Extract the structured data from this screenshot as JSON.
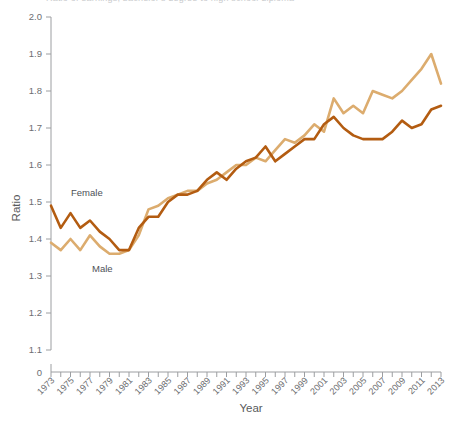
{
  "figure": {
    "title_clipped": "Ratio of earnings, bachelor's degree to high school diploma",
    "ylabel": "Ratio",
    "xlabel": "Year"
  },
  "axes": {
    "y_ticks": [
      "0",
      "1.1",
      "1.2",
      "1.3",
      "1.4",
      "1.5",
      "1.6",
      "1.7",
      "1.8",
      "1.9",
      "2.0"
    ],
    "x_ticks": [
      "1973",
      "1975",
      "1977",
      "1979",
      "1981",
      "1983",
      "1985",
      "1987",
      "1989",
      "1991",
      "1993",
      "1995",
      "1997",
      "1999",
      "2001",
      "2003",
      "2005",
      "2007",
      "2009",
      "2011",
      "2013"
    ]
  },
  "series_labels": {
    "female": "Female",
    "male": "Male"
  },
  "colors": {
    "female": "#b35c11",
    "male": "#dcac6e",
    "axis": "#9c9ea1",
    "text": "#58595b"
  },
  "chart_data": {
    "type": "line",
    "title": "Ratio of earnings, bachelor's degree to high school diploma",
    "xlabel": "Year",
    "ylabel": "Ratio",
    "xlim": [
      1973,
      2013
    ],
    "ylim": [
      1.05,
      2.0
    ],
    "ybreak": true,
    "grid": false,
    "legend_position": "inline-annotation",
    "x": [
      1973,
      1974,
      1975,
      1976,
      1977,
      1978,
      1979,
      1980,
      1981,
      1982,
      1983,
      1984,
      1985,
      1986,
      1987,
      1988,
      1989,
      1990,
      1991,
      1992,
      1993,
      1994,
      1995,
      1996,
      1997,
      1998,
      1999,
      2000,
      2001,
      2002,
      2003,
      2004,
      2005,
      2006,
      2007,
      2008,
      2009,
      2010,
      2011,
      2012,
      2013
    ],
    "series": [
      {
        "name": "Female",
        "color": "#b35c11",
        "values": [
          1.49,
          1.43,
          1.47,
          1.43,
          1.45,
          1.42,
          1.4,
          1.37,
          1.37,
          1.43,
          1.46,
          1.46,
          1.5,
          1.52,
          1.52,
          1.53,
          1.56,
          1.58,
          1.56,
          1.59,
          1.61,
          1.62,
          1.65,
          1.61,
          1.63,
          1.65,
          1.67,
          1.67,
          1.71,
          1.73,
          1.7,
          1.68,
          1.67,
          1.67,
          1.67,
          1.69,
          1.72,
          1.7,
          1.71,
          1.75,
          1.76
        ]
      },
      {
        "name": "Male",
        "color": "#dcac6e",
        "values": [
          1.39,
          1.37,
          1.4,
          1.37,
          1.41,
          1.38,
          1.36,
          1.36,
          1.37,
          1.41,
          1.48,
          1.49,
          1.51,
          1.52,
          1.53,
          1.53,
          1.55,
          1.56,
          1.58,
          1.6,
          1.6,
          1.62,
          1.61,
          1.64,
          1.67,
          1.66,
          1.68,
          1.71,
          1.69,
          1.78,
          1.74,
          1.76,
          1.74,
          1.8,
          1.79,
          1.78,
          1.8,
          1.83,
          1.86,
          1.9,
          1.82
        ]
      }
    ]
  }
}
